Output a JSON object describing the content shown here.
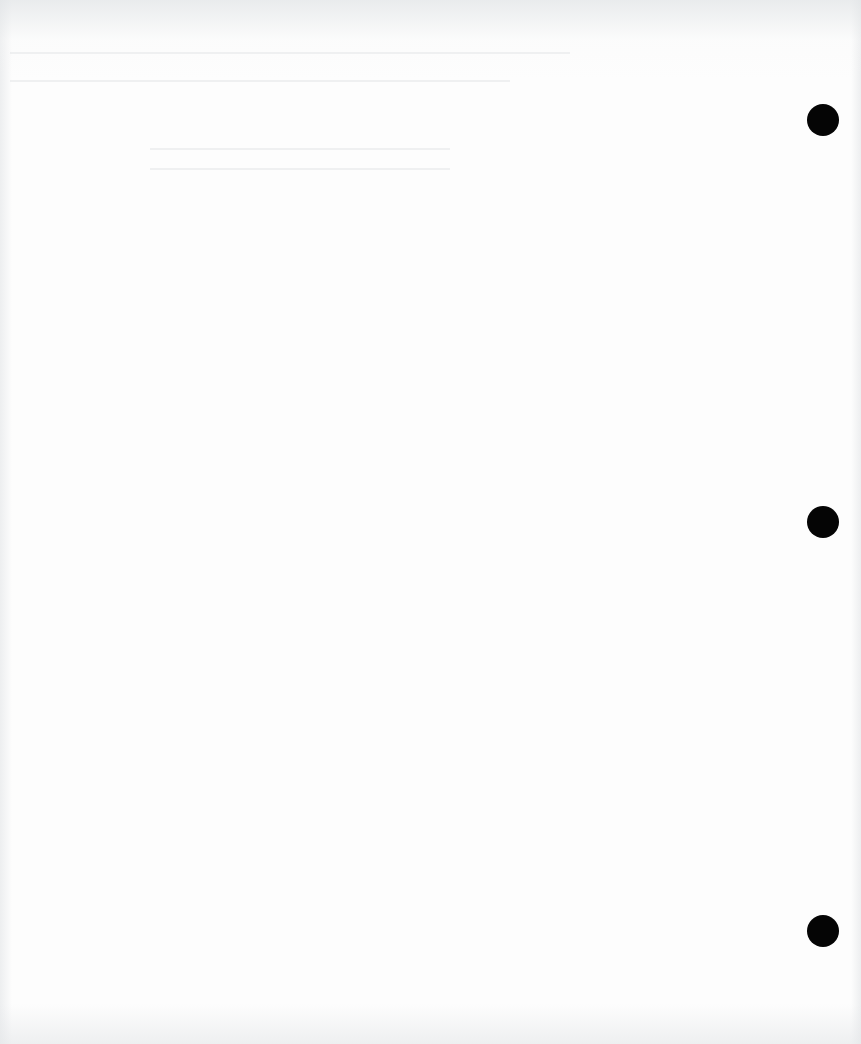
{
  "document": {
    "type": "scanned-blank-page",
    "background_color": "#fdfdfd",
    "punch_holes": [
      {
        "cx": 823,
        "cy": 120
      },
      {
        "cx": 823,
        "cy": 522
      },
      {
        "cx": 823,
        "cy": 931
      }
    ],
    "hole_color": "#050505"
  }
}
